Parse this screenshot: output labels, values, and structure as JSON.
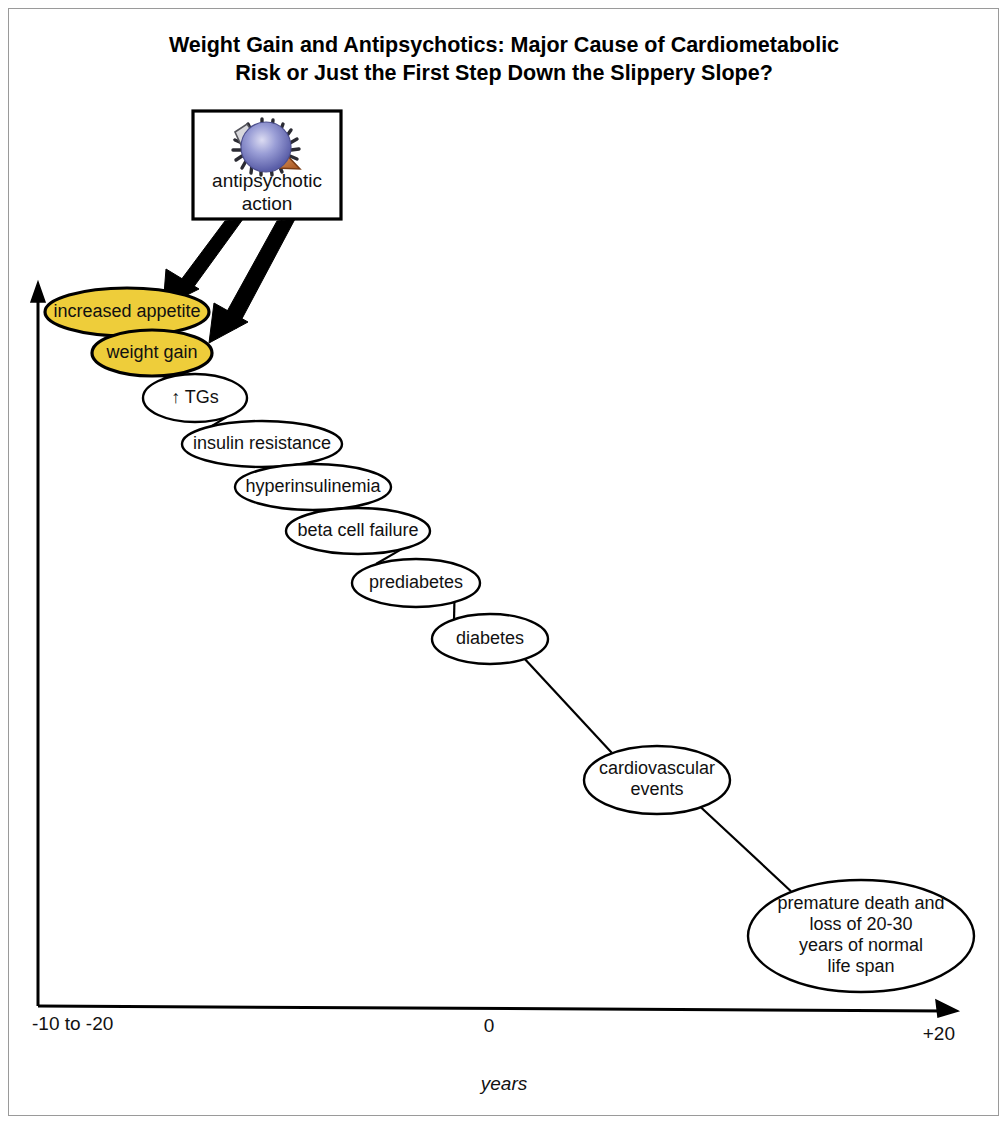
{
  "figure": {
    "title_line1": "Weight Gain and Antipsychotics: Major Cause of Cardiometabolic",
    "title_line2": "Risk or Just the First Step Down the Slippery Slope?",
    "source_box": {
      "label_line1": "antipsychotic",
      "label_line2": "action",
      "icon": "receptor-molecule-icon"
    },
    "axis": {
      "x_title": "years",
      "x_ticks": [
        "-10 to -20",
        "0",
        "+20"
      ]
    },
    "colors": {
      "highlight_fill": "#EECD3A",
      "node_fill": "#FFFFFF",
      "stroke": "#000000",
      "frame": "#9A9A9A",
      "molecule_sphere": "#7B7FC4",
      "molecule_wedge": "#C06A2E"
    }
  },
  "chart_data": {
    "type": "diagram",
    "title": "Weight Gain and Antipsychotics: Major Cause of Cardiometabolic Risk or Just the First Step Down the Slippery Slope?",
    "xlabel": "years",
    "ylabel": "",
    "xticks": [
      "-10 to -20",
      "0",
      "+20"
    ],
    "grid": false,
    "legend": "none",
    "nodes": [
      {
        "id": "increased-appetite",
        "label": "increased appetite",
        "lines": [
          "increased appetite"
        ],
        "highlighted": true,
        "cx": 127,
        "cy": 312,
        "rx": 82,
        "ry": 24,
        "font_size": 18
      },
      {
        "id": "weight-gain",
        "label": "weight gain",
        "lines": [
          "weight gain"
        ],
        "highlighted": true,
        "cx": 152,
        "cy": 353,
        "rx": 60,
        "ry": 23,
        "font_size": 18
      },
      {
        "id": "tgs",
        "label": "↑ TGs",
        "lines": [
          "↑ TGs"
        ],
        "highlighted": false,
        "cx": 195,
        "cy": 398,
        "rx": 52,
        "ry": 24,
        "font_size": 18
      },
      {
        "id": "insulin-resistance",
        "label": "insulin resistance",
        "lines": [
          "insulin resistance"
        ],
        "highlighted": false,
        "cx": 262,
        "cy": 444,
        "rx": 80,
        "ry": 23,
        "font_size": 18
      },
      {
        "id": "hyperinsulinemia",
        "label": "hyperinsulinemia",
        "lines": [
          "hyperinsulinemia"
        ],
        "highlighted": false,
        "cx": 313,
        "cy": 487,
        "rx": 78,
        "ry": 23,
        "font_size": 18
      },
      {
        "id": "beta-cell-failure",
        "label": "beta cell failure",
        "lines": [
          "beta cell failure"
        ],
        "highlighted": false,
        "cx": 358,
        "cy": 531,
        "rx": 72,
        "ry": 23,
        "font_size": 18
      },
      {
        "id": "prediabetes",
        "label": "prediabetes",
        "lines": [
          "prediabetes"
        ],
        "highlighted": false,
        "cx": 416,
        "cy": 583,
        "rx": 64,
        "ry": 24,
        "font_size": 18
      },
      {
        "id": "diabetes",
        "label": "diabetes",
        "lines": [
          "diabetes"
        ],
        "highlighted": false,
        "cx": 490,
        "cy": 639,
        "rx": 58,
        "ry": 25,
        "font_size": 18
      },
      {
        "id": "cardiovascular-events",
        "label": "cardiovascular events",
        "lines": [
          "cardiovascular",
          "events"
        ],
        "highlighted": false,
        "cx": 657,
        "cy": 780,
        "rx": 73,
        "ry": 34,
        "font_size": 18
      },
      {
        "id": "premature-death",
        "label": "premature death and loss of 20-30 years of normal life span",
        "lines": [
          "premature death and",
          "loss of 20-30",
          "years of normal",
          "life span"
        ],
        "highlighted": false,
        "cx": 861,
        "cy": 936,
        "rx": 113,
        "ry": 56,
        "font_size": 18
      }
    ],
    "connectors": [
      {
        "from": "increased-appetite",
        "to": "weight-gain"
      },
      {
        "from": "weight-gain",
        "to": "tgs"
      },
      {
        "from": "tgs",
        "to": "insulin-resistance"
      },
      {
        "from": "insulin-resistance",
        "to": "hyperinsulinemia"
      },
      {
        "from": "hyperinsulinemia",
        "to": "beta-cell-failure"
      },
      {
        "from": "beta-cell-failure",
        "to": "prediabetes"
      },
      {
        "from": "prediabetes",
        "to": "diabetes"
      },
      {
        "from": "diabetes",
        "to": "cardiovascular-events"
      },
      {
        "from": "cardiovascular-events",
        "to": "premature-death"
      }
    ],
    "source_arrows": [
      {
        "from": "antipsychotic-action",
        "to": "increased-appetite"
      },
      {
        "from": "antipsychotic-action",
        "to": "weight-gain"
      }
    ]
  }
}
